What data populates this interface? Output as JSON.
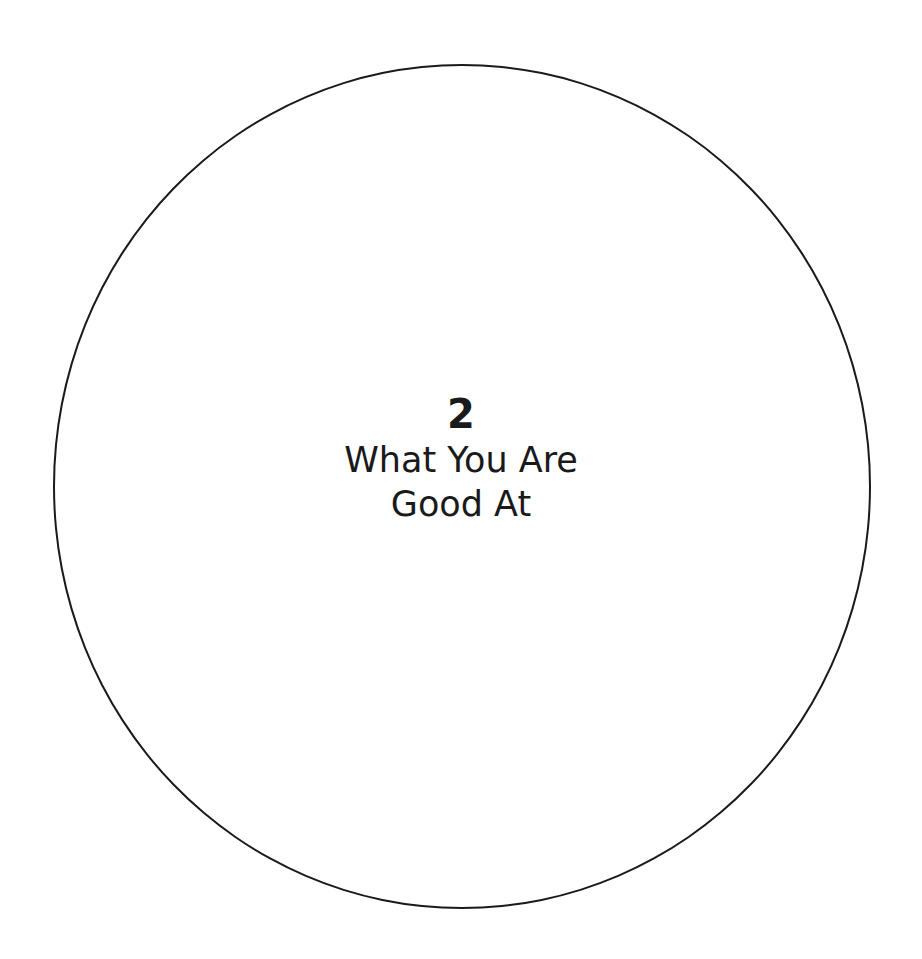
{
  "diagram": {
    "shape": "circle",
    "number": "2",
    "title_lines": [
      "What You Are",
      "Good At"
    ],
    "stroke_color": "#1a1a1a",
    "background": "#ffffff"
  }
}
